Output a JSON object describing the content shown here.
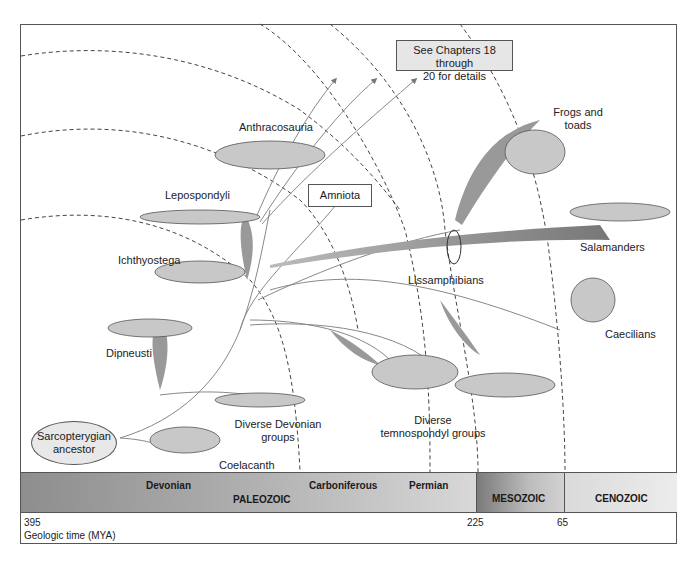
{
  "callouts": {
    "see_chapters": [
      "See Chapters 18 through",
      "20 for details"
    ],
    "amniota": "Amniota",
    "ancestor": [
      "Sarcopterygian",
      "ancestor"
    ]
  },
  "taxa": {
    "anthracosauria": "Anthracosauria",
    "lepospondyli": "Lepospondyli",
    "ichthyostega": "Ichthyostega",
    "dipneusti": "Dipneusti",
    "devonian_groups": [
      "Diverse Devonian",
      "groups"
    ],
    "coelacanth": "Coelacanth",
    "frogs": [
      "Frogs and",
      "toads"
    ],
    "salamanders": "Salamanders",
    "lissamphibians": "Lissamphibians",
    "caecilians": "Caecilians",
    "temnospondyl": [
      "Diverse",
      "temnospondyl groups"
    ]
  },
  "timeline": {
    "periods": [
      "Devonian",
      "Carboniferous",
      "Permian"
    ],
    "eras": [
      "PALEOZOIC",
      "MESOZOIC",
      "CENOZOIC"
    ],
    "ticks": [
      "395",
      "225",
      "65"
    ],
    "axis_label": "Geologic time (MYA)"
  }
}
